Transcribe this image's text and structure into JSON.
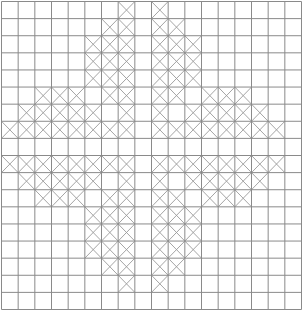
{
  "grid": {
    "rows": 18,
    "cols": 18,
    "line_color": "#8a8a8a",
    "cross_color": "#9a9a9a",
    "background": "#ffffff",
    "marked_cells": [
      [
        0,
        7
      ],
      [
        0,
        9
      ],
      [
        1,
        6
      ],
      [
        1,
        7
      ],
      [
        1,
        9
      ],
      [
        1,
        10
      ],
      [
        2,
        5
      ],
      [
        2,
        6
      ],
      [
        2,
        7
      ],
      [
        2,
        9
      ],
      [
        2,
        10
      ],
      [
        2,
        11
      ],
      [
        3,
        5
      ],
      [
        3,
        6
      ],
      [
        3,
        7
      ],
      [
        3,
        9
      ],
      [
        3,
        10
      ],
      [
        3,
        11
      ],
      [
        4,
        5
      ],
      [
        4,
        6
      ],
      [
        4,
        7
      ],
      [
        4,
        9
      ],
      [
        4,
        10
      ],
      [
        4,
        11
      ],
      [
        5,
        2
      ],
      [
        5,
        3
      ],
      [
        5,
        4
      ],
      [
        5,
        6
      ],
      [
        5,
        7
      ],
      [
        5,
        9
      ],
      [
        5,
        10
      ],
      [
        5,
        12
      ],
      [
        5,
        13
      ],
      [
        5,
        14
      ],
      [
        6,
        1
      ],
      [
        6,
        2
      ],
      [
        6,
        3
      ],
      [
        6,
        4
      ],
      [
        6,
        5
      ],
      [
        6,
        7
      ],
      [
        6,
        9
      ],
      [
        6,
        11
      ],
      [
        6,
        12
      ],
      [
        6,
        13
      ],
      [
        6,
        14
      ],
      [
        6,
        15
      ],
      [
        7,
        0
      ],
      [
        7,
        1
      ],
      [
        7,
        2
      ],
      [
        7,
        3
      ],
      [
        7,
        4
      ],
      [
        7,
        5
      ],
      [
        7,
        6
      ],
      [
        7,
        7
      ],
      [
        7,
        9
      ],
      [
        7,
        10
      ],
      [
        7,
        11
      ],
      [
        7,
        12
      ],
      [
        7,
        13
      ],
      [
        7,
        14
      ],
      [
        7,
        15
      ],
      [
        7,
        16
      ],
      [
        9,
        0
      ],
      [
        9,
        1
      ],
      [
        9,
        2
      ],
      [
        9,
        3
      ],
      [
        9,
        4
      ],
      [
        9,
        5
      ],
      [
        9,
        6
      ],
      [
        9,
        7
      ],
      [
        9,
        9
      ],
      [
        9,
        10
      ],
      [
        9,
        11
      ],
      [
        9,
        12
      ],
      [
        9,
        13
      ],
      [
        9,
        14
      ],
      [
        9,
        15
      ],
      [
        9,
        16
      ],
      [
        10,
        1
      ],
      [
        10,
        2
      ],
      [
        10,
        3
      ],
      [
        10,
        4
      ],
      [
        10,
        5
      ],
      [
        10,
        7
      ],
      [
        10,
        9
      ],
      [
        10,
        11
      ],
      [
        10,
        12
      ],
      [
        10,
        13
      ],
      [
        10,
        14
      ],
      [
        10,
        15
      ],
      [
        11,
        2
      ],
      [
        11,
        3
      ],
      [
        11,
        4
      ],
      [
        11,
        6
      ],
      [
        11,
        7
      ],
      [
        11,
        9
      ],
      [
        11,
        10
      ],
      [
        11,
        12
      ],
      [
        11,
        13
      ],
      [
        11,
        14
      ],
      [
        12,
        5
      ],
      [
        12,
        6
      ],
      [
        12,
        7
      ],
      [
        12,
        9
      ],
      [
        12,
        10
      ],
      [
        12,
        11
      ],
      [
        13,
        5
      ],
      [
        13,
        6
      ],
      [
        13,
        7
      ],
      [
        13,
        9
      ],
      [
        13,
        10
      ],
      [
        13,
        11
      ],
      [
        14,
        5
      ],
      [
        14,
        6
      ],
      [
        14,
        7
      ],
      [
        14,
        9
      ],
      [
        14,
        10
      ],
      [
        14,
        11
      ],
      [
        15,
        6
      ],
      [
        15,
        7
      ],
      [
        15,
        9
      ],
      [
        15,
        10
      ],
      [
        16,
        7
      ],
      [
        16,
        9
      ]
    ]
  }
}
